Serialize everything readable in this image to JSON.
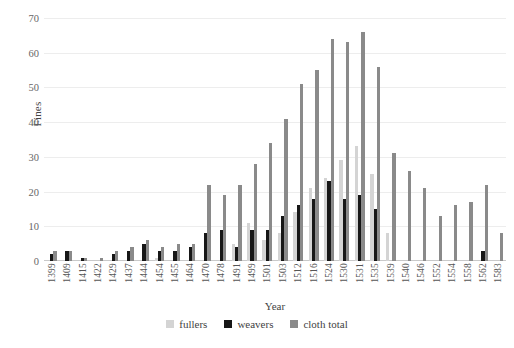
{
  "chart_data": {
    "type": "bar",
    "title": "",
    "xlabel": "Year",
    "ylabel": "Fines",
    "ylim": [
      0,
      70
    ],
    "yticks": [
      0,
      10,
      20,
      30,
      40,
      50,
      60,
      70
    ],
    "grid": true,
    "legend_position": "bottom",
    "categories": [
      "1399",
      "1409",
      "1415",
      "1422",
      "1429",
      "1437",
      "1444",
      "1454",
      "1455",
      "1464",
      "1470",
      "1478",
      "1491",
      "1499",
      "1501",
      "1503",
      "1512",
      "1516",
      "1524",
      "1530",
      "1531",
      "1535",
      "1539",
      "1540",
      "1546",
      "1552",
      "1554",
      "1558",
      "1562",
      "1583"
    ],
    "series": [
      {
        "name": "fullers",
        "color": "#d4d4d4",
        "values": [
          0,
          0,
          0,
          0,
          0,
          0,
          0,
          1,
          0,
          0,
          0,
          0,
          5,
          11,
          6,
          8,
          14,
          21,
          24,
          29,
          33,
          25,
          8,
          0,
          0,
          0,
          0,
          0,
          0,
          0
        ]
      },
      {
        "name": "weavers",
        "color": "#171717",
        "values": [
          2,
          3,
          1,
          0,
          2,
          3,
          5,
          3,
          3,
          4,
          8,
          9,
          4,
          9,
          9,
          13,
          16,
          18,
          23,
          18,
          19,
          15,
          0,
          0,
          0,
          0,
          0,
          0,
          3,
          0
        ]
      },
      {
        "name": "cloth total",
        "color": "#8a8a8a",
        "values": [
          3,
          3,
          1,
          1,
          3,
          4,
          6,
          4,
          5,
          5,
          22,
          19,
          22,
          28,
          34,
          41,
          51,
          55,
          64,
          63,
          66,
          56,
          31,
          26,
          21,
          13,
          16,
          17,
          22,
          8
        ]
      }
    ]
  },
  "legend": {
    "items": [
      {
        "label": "fullers",
        "key": "fullers"
      },
      {
        "label": "weavers",
        "key": "weavers"
      },
      {
        "label": "cloth total",
        "key": "total"
      }
    ]
  }
}
